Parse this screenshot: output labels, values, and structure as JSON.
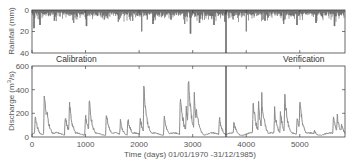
{
  "chart_data": [
    {
      "type": "bar",
      "panel": "top",
      "title": "",
      "ylabel": "Rainfall (mm)",
      "xlabel": "",
      "y_inverted": true,
      "ylim": [
        0,
        40
      ],
      "yticks": [
        "0",
        "20",
        "40"
      ],
      "xlim": [
        0,
        5844
      ],
      "xticks": [
        0,
        1000,
        2000,
        3000,
        4000,
        5000
      ],
      "grid": false,
      "series_color": "#3a3a3a",
      "description": "Daily rainfall hyetograph, mostly 0-12 mm with occasional spikes",
      "spikes": [
        {
          "x": 40,
          "y": 17
        },
        {
          "x": 150,
          "y": 14
        },
        {
          "x": 420,
          "y": 10
        },
        {
          "x": 780,
          "y": 12
        },
        {
          "x": 1020,
          "y": 15
        },
        {
          "x": 1350,
          "y": 9
        },
        {
          "x": 1610,
          "y": 11
        },
        {
          "x": 1880,
          "y": 10
        },
        {
          "x": 2050,
          "y": 20
        },
        {
          "x": 2260,
          "y": 13
        },
        {
          "x": 2600,
          "y": 9
        },
        {
          "x": 2850,
          "y": 13
        },
        {
          "x": 2960,
          "y": 22
        },
        {
          "x": 3130,
          "y": 12
        },
        {
          "x": 3400,
          "y": 14
        },
        {
          "x": 3600,
          "y": 11
        },
        {
          "x": 4000,
          "y": 20
        },
        {
          "x": 4350,
          "y": 10
        },
        {
          "x": 4700,
          "y": 13
        },
        {
          "x": 4950,
          "y": 14
        },
        {
          "x": 5300,
          "y": 12
        },
        {
          "x": 5650,
          "y": 15
        }
      ],
      "annotations": [
        "Calibration",
        "Verification"
      ],
      "split_x": 3652
    },
    {
      "type": "line",
      "panel": "bottom",
      "title": "",
      "ylabel": "Discharge (m3/s)",
      "xlabel": "Time (days) 01/01/1970 -31/12/1985)",
      "ylim": [
        0,
        600
      ],
      "yticks": [
        "0",
        "200",
        "400",
        "600"
      ],
      "xlim": [
        0,
        5844
      ],
      "xticks": [
        0,
        1000,
        2000,
        3000,
        4000,
        5000
      ],
      "grid": false,
      "series_color": "#8c8c8c",
      "baseflow": 25,
      "peaks": [
        {
          "x": 60,
          "y": 190
        },
        {
          "x": 230,
          "y": 410
        },
        {
          "x": 280,
          "y": 240
        },
        {
          "x": 620,
          "y": 200
        },
        {
          "x": 700,
          "y": 320
        },
        {
          "x": 1000,
          "y": 200
        },
        {
          "x": 1070,
          "y": 335
        },
        {
          "x": 1390,
          "y": 230
        },
        {
          "x": 1650,
          "y": 150
        },
        {
          "x": 1790,
          "y": 180
        },
        {
          "x": 2020,
          "y": 175
        },
        {
          "x": 2090,
          "y": 470
        },
        {
          "x": 2130,
          "y": 210
        },
        {
          "x": 2470,
          "y": 180
        },
        {
          "x": 2770,
          "y": 400
        },
        {
          "x": 2880,
          "y": 250
        },
        {
          "x": 2920,
          "y": 570
        },
        {
          "x": 3030,
          "y": 350
        },
        {
          "x": 3070,
          "y": 270
        },
        {
          "x": 3500,
          "y": 170
        },
        {
          "x": 3770,
          "y": 140
        },
        {
          "x": 4130,
          "y": 330
        },
        {
          "x": 4230,
          "y": 290
        },
        {
          "x": 4290,
          "y": 350
        },
        {
          "x": 4530,
          "y": 240
        },
        {
          "x": 4640,
          "y": 220
        },
        {
          "x": 4720,
          "y": 390
        },
        {
          "x": 4950,
          "y": 180
        },
        {
          "x": 5000,
          "y": 350
        },
        {
          "x": 5270,
          "y": 60
        },
        {
          "x": 5630,
          "y": 200
        },
        {
          "x": 5700,
          "y": 190
        },
        {
          "x": 5780,
          "y": 120
        }
      ]
    }
  ],
  "labels": {
    "rain_ylabel": "Rainfall (mm)",
    "q_ylabel_main": "Discharge (m",
    "q_ylabel_sup": "3",
    "q_ylabel_tail": "/s)",
    "xlabel": "Time (days) 01/01/1970 -31/12/1985)",
    "calibration": "Calibration",
    "verification": "Verification",
    "rain_ticks": [
      "0",
      "20",
      "40"
    ],
    "q_ticks": [
      "600",
      "400",
      "200",
      "0"
    ],
    "x_ticks": [
      "0",
      "1000",
      "2000",
      "3000",
      "4000",
      "5000"
    ]
  }
}
